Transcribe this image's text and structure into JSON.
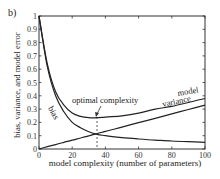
{
  "panel_label": "b)",
  "chart_data": {
    "type": "line",
    "title": "",
    "xlabel": "model complexity (number of parameters)",
    "ylabel": "bias, variance, and model error",
    "xlim": [
      0,
      100
    ],
    "ylim": [
      0,
      1
    ],
    "xticks": [
      "0",
      "20",
      "40",
      "60",
      "80",
      "100"
    ],
    "yticks": [
      "0",
      "0.1",
      "0.2",
      "0.3",
      "0.4",
      "0.5",
      "0.6",
      "0.7",
      "0.8",
      "0.9",
      "1"
    ],
    "grid": false,
    "legend": "none (inline curve labels)",
    "x": [
      0,
      5,
      10,
      15,
      20,
      25,
      30,
      35,
      40,
      50,
      60,
      70,
      80,
      90,
      100
    ],
    "series": [
      {
        "name": "bias",
        "values": [
          1.0,
          0.62,
          0.4,
          0.28,
          0.2,
          0.16,
          0.13,
          0.11,
          0.1,
          0.085,
          0.075,
          0.067,
          0.06,
          0.055,
          0.05
        ]
      },
      {
        "name": "variance",
        "values": [
          0.0,
          0.017,
          0.033,
          0.05,
          0.066,
          0.083,
          0.099,
          0.116,
          0.132,
          0.165,
          0.198,
          0.231,
          0.264,
          0.297,
          0.33
        ]
      },
      {
        "name": "model",
        "values": [
          1.0,
          0.64,
          0.43,
          0.33,
          0.27,
          0.245,
          0.235,
          0.235,
          0.24,
          0.25,
          0.27,
          0.3,
          0.32,
          0.35,
          0.38
        ]
      }
    ],
    "annotations": [
      {
        "text": "optimal complexity",
        "x": 35,
        "y": 0.235,
        "style": "arrow + dashed vertical line"
      },
      {
        "text": "model",
        "near_x": 90
      },
      {
        "text": "variance",
        "near_x": 88
      },
      {
        "text": "bias",
        "near_x": 8
      }
    ]
  },
  "labels": {
    "optimal": "optimal complexity",
    "model": "model",
    "variance": "variance",
    "bias": "bias"
  }
}
